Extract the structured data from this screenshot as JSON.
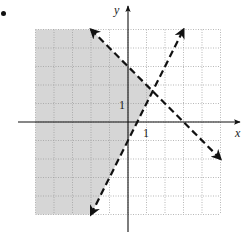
{
  "chart_data": {
    "type": "line",
    "title": "",
    "xlabel": "x",
    "ylabel": "y",
    "xlim": [
      -5,
      5
    ],
    "ylim": [
      -5,
      5
    ],
    "grid": true,
    "tick_labels": {
      "x": [
        "1"
      ],
      "y": [
        "1"
      ]
    },
    "series": [
      {
        "name": "boundary-1",
        "equation": "y = -x + 3",
        "style": "dashed",
        "x": [
          -2,
          5
        ],
        "y": [
          5,
          -2
        ]
      },
      {
        "name": "boundary-2",
        "equation": "y = 2x - 1",
        "style": "dashed",
        "x": [
          -2,
          3
        ],
        "y": [
          -5,
          5
        ]
      }
    ],
    "intersection": {
      "x": 1.333,
      "y": 1.667
    },
    "shaded_region": {
      "description": "y < -x + 3 and y > 2x - 1",
      "color": "#d6d6d6"
    }
  },
  "labels": {
    "x_axis": "x",
    "y_axis": "y",
    "x_tick": "1",
    "y_tick": "1"
  },
  "colors": {
    "shade": "#d6d6d6",
    "grid": "#9a9a9a",
    "axis": "#111111",
    "line": "#111111"
  }
}
